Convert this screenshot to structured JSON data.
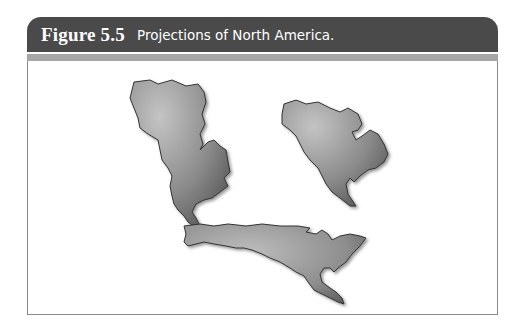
{
  "figure": {
    "number": "Figure 5.5",
    "caption": "Projections of North America.",
    "header_color": "#4a4a4a",
    "band_color": "#a6a6a6",
    "border_color": "#8a8a8a"
  },
  "maps": [
    {
      "id": "projection-1",
      "description": "North America map projection (distorted, tall)"
    },
    {
      "id": "projection-2",
      "description": "North America map projection (compact)"
    },
    {
      "id": "projection-3",
      "description": "North America map projection (wide, stretched horizontally)"
    }
  ]
}
